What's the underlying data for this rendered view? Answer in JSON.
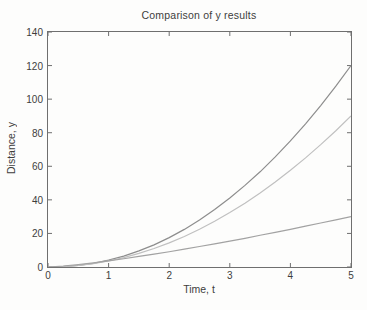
{
  "figure": {
    "title": "Comparison of y results",
    "xlabel": "Time, t",
    "ylabel": "Distance, y"
  },
  "colors": {
    "background": "#fdfdfc",
    "axis_frame": "#6f6f6f",
    "tick": "#6f6f6f",
    "text": "#3d3d3d",
    "upper_curve": "#8d8d8d",
    "middle_curve": "#c0c0c0",
    "lower_curve": "#a2a2a2"
  },
  "chart_data": {
    "type": "line",
    "title": "Comparison of y results",
    "xlabel": "Time, t",
    "ylabel": "Distance, y",
    "xlim": [
      0,
      5
    ],
    "ylim": [
      0,
      140
    ],
    "xticks": [
      0,
      1,
      2,
      3,
      4,
      5
    ],
    "yticks": [
      0,
      20,
      40,
      60,
      80,
      100,
      120,
      140
    ],
    "grid": false,
    "legend": "none",
    "x": [
      0,
      0.25,
      0.5,
      0.75,
      1,
      1.25,
      1.5,
      1.75,
      2,
      2.25,
      2.5,
      2.75,
      3,
      3.25,
      3.5,
      3.75,
      4,
      4.25,
      4.5,
      4.75,
      5
    ],
    "series": [
      {
        "name": "upper-curve",
        "color": "#8d8d8d",
        "values": [
          0,
          0.2,
          1.0,
          2.2,
          4.1,
          6.5,
          9.6,
          13.2,
          17.5,
          22.4,
          28.0,
          34.2,
          41.1,
          48.6,
          56.7,
          65.6,
          75.1,
          85.3,
          96.2,
          107.7,
          120
        ]
      },
      {
        "name": "middle-curve",
        "color": "#c0c0c0",
        "values": [
          0,
          0.2,
          0.9,
          2.0,
          3.6,
          5.6,
          8.1,
          11.0,
          14.4,
          18.2,
          22.5,
          27.2,
          32.4,
          38.0,
          44.1,
          50.6,
          57.6,
          65.0,
          72.9,
          81.2,
          90
        ]
      },
      {
        "name": "lower-curve",
        "color": "#a2a2a2",
        "values": [
          0,
          0.6,
          1.5,
          2.5,
          3.7,
          4.9,
          6.3,
          7.7,
          9.1,
          10.6,
          12.2,
          13.8,
          15.4,
          17.1,
          18.9,
          20.6,
          22.4,
          24.3,
          26.2,
          28.1,
          30
        ]
      }
    ]
  }
}
